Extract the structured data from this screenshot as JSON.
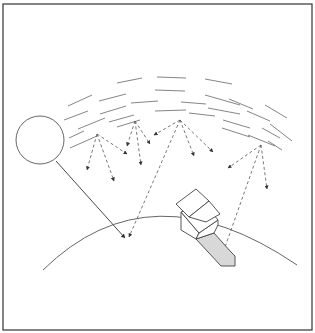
{
  "diagram": {
    "elements": {
      "frame": "border",
      "sun": "sun-circle",
      "atmosphere": "scattering-arcs",
      "direct_beam": "solid-arrow",
      "scattered_rays": "dashed-arrows",
      "earth": "ground-curve",
      "house": "house-shape",
      "shadow": "shaded-region"
    },
    "colors": {
      "line": "#555555",
      "shadow_fill": "#d8d8d8",
      "background": "#ffffff"
    }
  }
}
